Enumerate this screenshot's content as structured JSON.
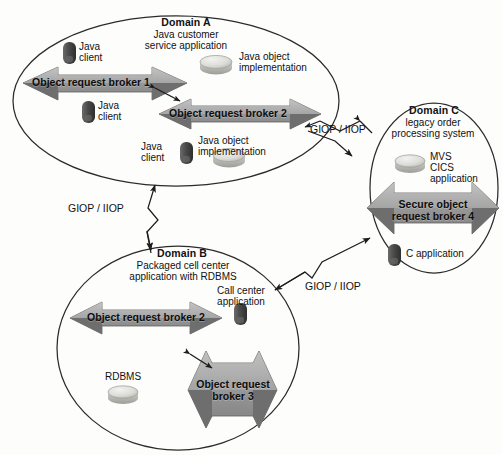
{
  "diagram": {
    "background": "#fdfdfc",
    "colors": {
      "outline": "#2b2b2b",
      "arrow_body": "#8d8d8d",
      "arrow_light": "#a9a9a9",
      "arrow_dark": "#6e6e6e",
      "client_icon": "#4a4a4a",
      "disk_icon": "#d8d8d4",
      "text": "#111111"
    }
  },
  "domains": [
    {
      "id": "A",
      "title": "Domain A",
      "subtitle": "Java customer\nservice application",
      "nodes": [
        {
          "name": "java-client-1",
          "label": "Java\nclient",
          "icon": "client-icon"
        },
        {
          "name": "java-client-2",
          "label": "Java\nclient",
          "icon": "client-icon"
        },
        {
          "name": "java-client-3",
          "label": "Java\nclient",
          "icon": "client-icon"
        },
        {
          "name": "java-object-implementation-1",
          "label": "Java object\nimplementation",
          "icon": "disk-icon"
        },
        {
          "name": "java-object-implementation-2",
          "label": "Java object\nimplementation",
          "icon": "disk-icon"
        }
      ],
      "brokers": [
        {
          "name": "object-request-broker-1",
          "label": "Object request broker 1"
        },
        {
          "name": "object-request-broker-2",
          "label": "Object request broker 2"
        }
      ]
    },
    {
      "id": "B",
      "title": "Domain B",
      "subtitle": "Packaged cell center\napplication with RDBMS",
      "nodes": [
        {
          "name": "call-center-application",
          "label": "Call center\napplication",
          "icon": "client-icon"
        },
        {
          "name": "rdbms",
          "label": "RDBMS",
          "icon": "disk-icon"
        }
      ],
      "brokers": [
        {
          "name": "object-request-broker-2",
          "label": "Object request broker 2"
        },
        {
          "name": "object-request-broker-3",
          "label": "Object request\nbroker 3"
        }
      ]
    },
    {
      "id": "C",
      "title": "Domain C",
      "subtitle": "legacy order\nprocessing system",
      "nodes": [
        {
          "name": "mvs-cics-application",
          "label": "MVS\nCICS\napplication",
          "icon": "disk-icon"
        },
        {
          "name": "c-application",
          "label": "C application",
          "icon": "client-icon"
        }
      ],
      "brokers": [
        {
          "name": "secure-object-request-broker-4",
          "label": "Secure object\nrequest broker 4"
        }
      ]
    }
  ],
  "connectors": [
    {
      "name": "giop-iiop-a-to-c",
      "label": "GIOP / IIOP"
    },
    {
      "name": "giop-iiop-a-to-b",
      "label": "GIOP / IIOP"
    },
    {
      "name": "giop-iiop-b-to-c",
      "label": "GIOP / IIOP"
    }
  ]
}
